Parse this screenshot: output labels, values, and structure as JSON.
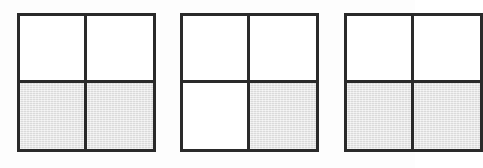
{
  "diagram": {
    "type": "fraction-area-model",
    "background_color": "#fdfdfd",
    "border_color": "#2a2a2a",
    "shade_color": "#e9e9e9",
    "unshaded_color": "#ffffff",
    "border_width_px": 3,
    "grid_rows": 2,
    "grid_cols": 2,
    "squares": [
      {
        "id": "square-1",
        "label": "",
        "shaded_count": 2,
        "total_parts": 4,
        "fraction": "2/4",
        "clipped": false,
        "x": 17,
        "y": 13,
        "width": 139,
        "height": 139,
        "cells": [
          {
            "row": 0,
            "col": 0,
            "shaded": false
          },
          {
            "row": 0,
            "col": 1,
            "shaded": false
          },
          {
            "row": 1,
            "col": 0,
            "shaded": true
          },
          {
            "row": 1,
            "col": 1,
            "shaded": true
          }
        ]
      },
      {
        "id": "square-2",
        "label": "",
        "shaded_count": 1,
        "total_parts": 4,
        "fraction": "1/4",
        "clipped": false,
        "x": 180,
        "y": 13,
        "width": 139,
        "height": 139,
        "cells": [
          {
            "row": 0,
            "col": 0,
            "shaded": false
          },
          {
            "row": 0,
            "col": 1,
            "shaded": false
          },
          {
            "row": 1,
            "col": 0,
            "shaded": false
          },
          {
            "row": 1,
            "col": 1,
            "shaded": true
          }
        ]
      },
      {
        "id": "square-3",
        "label": "",
        "shaded_count": 1,
        "total_parts": 4,
        "fraction": "1/4",
        "clipped": true,
        "x": 344,
        "y": 13,
        "width": 139,
        "height": 139,
        "cells": [
          {
            "row": 0,
            "col": 0,
            "shaded": false
          },
          {
            "row": 0,
            "col": 1,
            "shaded": false
          },
          {
            "row": 1,
            "col": 0,
            "shaded": true
          },
          {
            "row": 1,
            "col": 1,
            "shaded": true
          }
        ]
      }
    ]
  }
}
